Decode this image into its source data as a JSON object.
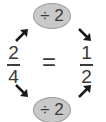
{
  "top_operation": {
    "label": "÷ 2"
  },
  "bottom_operation": {
    "label": "÷ 2"
  },
  "left_fraction": {
    "numerator": "2",
    "denominator": "4"
  },
  "equals": "=",
  "right_fraction": {
    "numerator": "1",
    "denominator": "2"
  },
  "colors": {
    "oval_fill": "#c9c9c9",
    "oval_border": "#9a9a9a",
    "text": "#3a3a3a",
    "arrow": "#1a1a1a"
  }
}
